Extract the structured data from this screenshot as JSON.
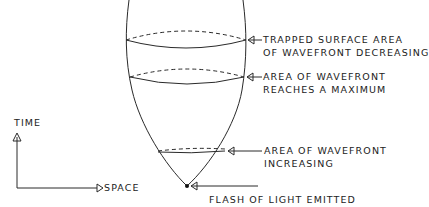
{
  "diagram": {
    "type": "spacetime-light-cone",
    "axes": {
      "time_label": "TIME",
      "space_label": "SPACE"
    },
    "annotations": [
      {
        "id": "trapped",
        "line1": "TRAPPED SURFACE AREA",
        "line2": "OF WAVEFRONT DECREASING"
      },
      {
        "id": "maximum",
        "line1": "AREA OF WAVEFRONT",
        "line2": "REACHES A MAXIMUM"
      },
      {
        "id": "increasing",
        "line1": "AREA OF WAVEFRONT",
        "line2": "INCREASING"
      },
      {
        "id": "flash",
        "line1": "FLASH OF LIGHT EMITTED"
      }
    ],
    "colors": {
      "ink": "#2a2a2a",
      "background": "#ffffff"
    }
  }
}
